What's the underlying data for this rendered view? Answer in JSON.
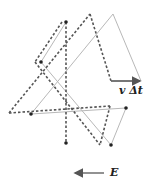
{
  "diagram": {
    "labels": {
      "velocity_displacement": "v Δt",
      "field": "E"
    },
    "colors": {
      "solid_line": "#b8b8b8",
      "dashed_line": "#555555",
      "dot": "#222222",
      "arrow": "#555555"
    },
    "dots": [
      {
        "x": 66,
        "y": 22
      },
      {
        "x": 41,
        "y": 62
      },
      {
        "x": 31,
        "y": 114
      },
      {
        "x": 126,
        "y": 108
      },
      {
        "x": 111,
        "y": 145
      },
      {
        "x": 66,
        "y": 143
      }
    ]
  }
}
